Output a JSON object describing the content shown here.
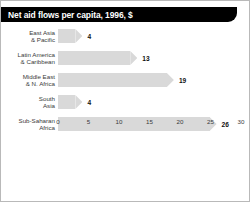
{
  "header": {
    "title": "Net aid flows per capita, 1996, $"
  },
  "colors": {
    "header_bg": "#000000",
    "header_text": "#ffffff",
    "bar_fill": "#d9d9d9",
    "label_text": "#3a3a3a",
    "frame_border": "#b9b9b9",
    "page_bg": "#ffffff"
  },
  "chart_data": {
    "type": "bar",
    "orientation": "horizontal",
    "title": "Net aid flows per capita, 1996, $",
    "xlabel": "",
    "ylabel": "",
    "categories": [
      "East Asia\n& Pacific",
      "Latin America\n& Caribbean",
      "Middle East\n& N. Africa",
      "South\nAsia",
      "Sub-Saharan\nAfrica"
    ],
    "values": [
      4,
      13,
      19,
      4,
      26
    ],
    "value_labels": [
      "4",
      "13",
      "19",
      "4",
      "26"
    ],
    "xlim": [
      0,
      30
    ],
    "xticks": [
      0,
      5,
      10,
      15,
      20,
      25,
      30
    ],
    "xtick_labels": [
      "0",
      "5",
      "10",
      "15",
      "20",
      "25",
      "30"
    ],
    "grid": false,
    "legend": null,
    "bar_style": "arrow-head-right"
  }
}
